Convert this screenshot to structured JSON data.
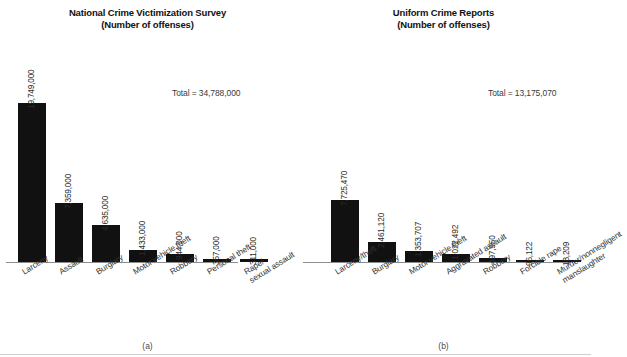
{
  "figure": {
    "caption_a": "(a)",
    "caption_b": "(b)"
  },
  "chart_data": [
    {
      "type": "bar",
      "panel": "a",
      "title": "National Crime Victimization Survey",
      "subtitle": "(Number of offenses)",
      "xlabel": "",
      "ylabel": "",
      "grid": false,
      "legend": "none",
      "annotations": [
        "Total = 34,788,000"
      ],
      "total_label": "Total = 34,788,000",
      "total_value": 34788000,
      "ylim": [
        0,
        19749000
      ],
      "categories": [
        "Larceny",
        "Assault",
        "Burglary",
        "Motor vehicle theft",
        "Robbery",
        "Personal theft",
        "Rape/ sexual assault"
      ],
      "category_lines": [
        [
          "Larceny"
        ],
        [
          "Assault"
        ],
        [
          "Burglary"
        ],
        [
          "Motor vehicle theft"
        ],
        [
          "Robbery"
        ],
        [
          "Personal theft"
        ],
        [
          "Rape/",
          "sexual assault"
        ]
      ],
      "values": [
        19749000,
        7359000,
        4635000,
        1433000,
        944000,
        357000,
        311000
      ],
      "value_labels": [
        "19,749,000",
        "7,359,000",
        "4,635,000",
        "1,433,000",
        "944,000",
        "357,000",
        "311,000"
      ]
    },
    {
      "type": "bar",
      "panel": "b",
      "title": "Uniform Crime Reports",
      "subtitle": "(Number of offenses)",
      "xlabel": "",
      "ylabel": "",
      "grid": false,
      "legend": "none",
      "annotations": [
        "Total = 13,175,070"
      ],
      "total_label": "Total = 13,175,070",
      "total_value": 13175070,
      "ylim": [
        0,
        7725470
      ],
      "categories": [
        "Larceny/theft",
        "Burglary",
        "Motor vehicle theft",
        "Aggravated assault",
        "Robbery",
        "Forcible rape",
        "Murder/nonnegligent manslaughter"
      ],
      "category_lines": [
        [
          "Larceny/theft"
        ],
        [
          "Burglary"
        ],
        [
          "Motor vehicle theft"
        ],
        [
          "Aggravated assault"
        ],
        [
          "Robbery"
        ],
        [
          "Forcible rape"
        ],
        [
          "Murder/nonnegligent",
          "manslaughter"
        ]
      ],
      "values": [
        7725470,
        2461120,
        1353707,
        1022492,
        497950,
        96122,
        18209
      ],
      "value_labels": [
        "7,725,470",
        "2,461,120",
        "1,353,707",
        "1,022,492",
        "497,950",
        "96,122",
        "18,209"
      ]
    }
  ],
  "colors": {
    "bar": "#111111",
    "axis": "#8d8d8d",
    "text": "#2b2b2b",
    "background": "#ffffff"
  }
}
